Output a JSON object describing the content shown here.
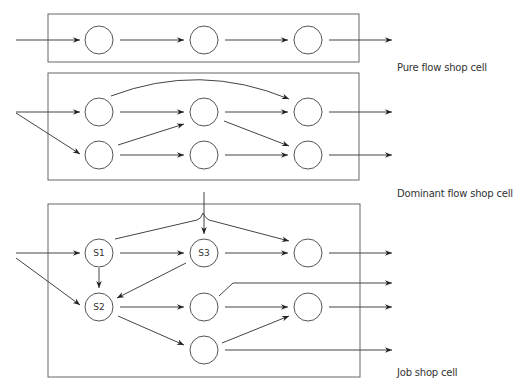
{
  "diagram": {
    "cells": [
      {
        "id": "pure",
        "label": "Pure flow shop cell"
      },
      {
        "id": "dominant",
        "label": "Dominant flow shop cell"
      },
      {
        "id": "job",
        "label": "Job shop cell"
      }
    ],
    "nodes": {
      "s1": "S1",
      "s2": "S2",
      "s3": "S3"
    },
    "colors": {
      "stroke": "#555555",
      "text": "#333333",
      "background": "#ffffff"
    }
  }
}
